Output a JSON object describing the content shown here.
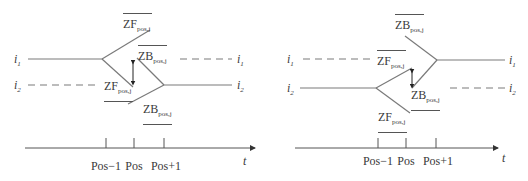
{
  "left_diagram": {
    "track_labels": {
      "i1": "i1",
      "i2": "i2"
    },
    "i1_left": "i",
    "i1_left_sub": "1",
    "i2_left": "i",
    "i2_left_sub": "2",
    "i1_right": "i",
    "i1_right_sub": "1",
    "i2_right": "i",
    "i2_right_sub": "2",
    "zf_top": {
      "base": "ZF",
      "sub": "pos,j"
    },
    "zb_mid": {
      "base": "ZB",
      "sub": "pos,j"
    },
    "zf_low": {
      "base": "ZF",
      "sub": "pos,j"
    },
    "zb_low": {
      "base": "ZB",
      "sub": "pos,j"
    },
    "axis": {
      "ticks": [
        "Pos−1",
        "Pos",
        "Pos+1"
      ],
      "axis_label": "t"
    }
  },
  "right_diagram": {
    "i1_left": "i",
    "i1_left_sub": "1",
    "i2_left": "i",
    "i2_left_sub": "2",
    "i1_right": "i",
    "i1_right_sub": "1",
    "i2_right": "i",
    "i2_right_sub": "2",
    "zb_top": {
      "base": "ZB",
      "sub": "pos,j"
    },
    "zf_mid": {
      "base": "ZF",
      "sub": "pos,j"
    },
    "zb_low": {
      "base": "ZB",
      "sub": "pos,j"
    },
    "zf_low": {
      "base": "ZF",
      "sub": "pos,j"
    },
    "axis": {
      "ticks": [
        "Pos−1",
        "Pos",
        "Pos+1"
      ],
      "axis_label": "t"
    }
  },
  "colors": {
    "line": "#6e6e6e",
    "text": "#3a3a3a"
  }
}
